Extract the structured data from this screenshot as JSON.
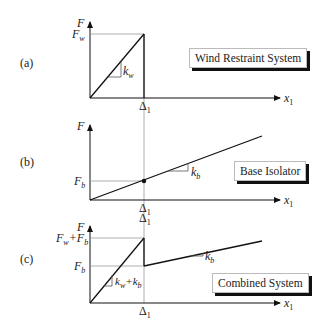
{
  "panels": [
    {
      "id": "a",
      "tag": "(a)",
      "system_label": "Wind Restraint System",
      "y_axis_label": "F",
      "x_axis_label": "x",
      "x_axis_sub": "1",
      "y_tick_labels": [
        {
          "main": "F",
          "sub": "w"
        }
      ],
      "x_tick_label": {
        "main": "Δ",
        "sub": "1"
      },
      "slope_label": {
        "main": "k",
        "sub": "w"
      }
    },
    {
      "id": "b",
      "tag": "(b)",
      "system_label": "Base Isolator",
      "y_axis_label": "F",
      "x_axis_label": "x",
      "x_axis_sub": "1",
      "y_tick_labels": [
        {
          "main": "F",
          "sub": "b"
        }
      ],
      "x_tick_label": {
        "main": "Δ",
        "sub": "1"
      },
      "slope_label": {
        "main": "k",
        "sub": "b"
      }
    },
    {
      "id": "c",
      "tag": "(c)",
      "system_label": "Combined System",
      "y_axis_label": "F",
      "x_axis_label": "x",
      "x_axis_sub": "1",
      "y_tick_labels": [
        {
          "main": "F",
          "sub": "w",
          "plus": "+F",
          "sub2": "b"
        },
        {
          "main": "F",
          "sub": "b"
        }
      ],
      "x_tick_label": {
        "main": "Δ",
        "sub": "1"
      },
      "slope_labels": [
        {
          "main": "k",
          "sub": "w",
          "plus": "+k",
          "sub2": "b"
        },
        {
          "main": "k",
          "sub": "b"
        }
      ]
    }
  ]
}
